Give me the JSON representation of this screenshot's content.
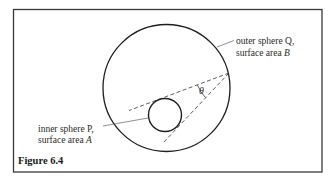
{
  "figure": {
    "caption": "Figure 6.4",
    "frame_color": "#3a3a3a",
    "line_color": "#1e1e1e"
  },
  "diagram": {
    "outer_sphere": {
      "label_line1": "outer sphere Q,",
      "label_line2_prefix": "surface area ",
      "label_line2_var": "B"
    },
    "inner_sphere": {
      "label_line1": "inner sphere P,",
      "label_line2_prefix": "surface area ",
      "label_line2_var": "A"
    },
    "angle": {
      "symbol": "θ"
    }
  }
}
